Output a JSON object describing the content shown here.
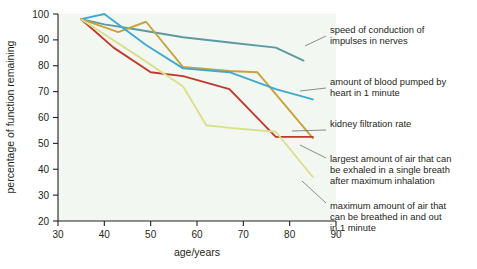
{
  "chart_data": {
    "type": "line",
    "title": "",
    "xlabel": "age/years",
    "ylabel": "percentage of function remaining",
    "xlim": [
      30,
      90
    ],
    "ylim": [
      20,
      100
    ],
    "xticks": [
      30,
      40,
      50,
      60,
      70,
      80,
      90
    ],
    "yticks": [
      20,
      30,
      40,
      50,
      60,
      70,
      80,
      90,
      100
    ],
    "grid": false,
    "legend_position": "right-annotations",
    "series": [
      {
        "name": "speed of conduction of impulses in nerves",
        "color": "#5b9aa0",
        "x": [
          35,
          40,
          47,
          57,
          67,
          77,
          83
        ],
        "y": [
          98,
          96,
          94,
          91,
          89,
          87,
          82
        ]
      },
      {
        "name": "amount of blood pumped by heart in 1 minute",
        "color": "#c9a23c",
        "x": [
          35,
          43,
          49,
          57,
          67,
          73,
          85
        ],
        "y": [
          98,
          93,
          97,
          79.5,
          78,
          77.5,
          52
        ]
      },
      {
        "name": "kidney filtration rate",
        "color": "#3fa9d0",
        "x": [
          35,
          40,
          49,
          57,
          67,
          77,
          85
        ],
        "y": [
          98,
          100,
          88,
          79,
          77.5,
          71,
          67
        ]
      },
      {
        "name": "largest amount of air that can be exhaled in a single breath after maximum inhalation",
        "color": "#c0392b",
        "x": [
          35,
          42,
          50,
          57,
          67,
          77,
          85
        ],
        "y": [
          98,
          87,
          77.5,
          76,
          71,
          52.5,
          52.5
        ]
      },
      {
        "name": "maximum amount of air that can be breathed in and out in 1 minute",
        "color": "#d9e08a",
        "x": [
          35,
          47,
          57,
          62,
          67,
          77,
          85
        ],
        "y": [
          98,
          84,
          72,
          57,
          56,
          54.5,
          37
        ]
      }
    ]
  },
  "annotations": [
    {
      "id": "annot-nerve-conduction",
      "lines": [
        "speed of conduction of",
        "impulses in nerves"
      ]
    },
    {
      "id": "annot-blood-pumped",
      "lines": [
        "amount of blood pumped by",
        "heart in 1 minute"
      ]
    },
    {
      "id": "annot-kidney-filtration",
      "lines": [
        "kidney filtration rate"
      ]
    },
    {
      "id": "annot-exhaled-air",
      "lines": [
        "largest amount of air that can",
        "be exhaled in a single breath",
        "after maximum inhalation"
      ]
    },
    {
      "id": "annot-breathed-air",
      "lines": [
        "maximum amount of air that",
        "can be breathed in and out",
        "in 1 minute"
      ]
    }
  ],
  "colors": {
    "background": "#ffffff",
    "plot_background": "#f2f7f2",
    "axis": "#231f20",
    "text": "#231f20",
    "leader_line": "#707070"
  }
}
